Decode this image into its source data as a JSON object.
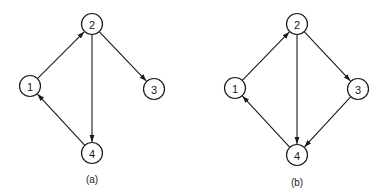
{
  "graphs": [
    {
      "caption": "(a)",
      "nodes": [
        {
          "id": "1",
          "label": "1",
          "x": 30,
          "y": 86
        },
        {
          "id": "2",
          "label": "2",
          "x": 92,
          "y": 24
        },
        {
          "id": "3",
          "label": "3",
          "x": 154,
          "y": 89
        },
        {
          "id": "4",
          "label": "4",
          "x": 92,
          "y": 153
        }
      ],
      "edges": [
        {
          "from": "1",
          "to": "2"
        },
        {
          "from": "2",
          "to": "3"
        },
        {
          "from": "2",
          "to": "4"
        },
        {
          "from": "4",
          "to": "1"
        }
      ],
      "caption_pos": {
        "x": 92,
        "y": 183
      }
    },
    {
      "caption": "(b)",
      "nodes": [
        {
          "id": "1",
          "label": "1",
          "x": 235,
          "y": 88
        },
        {
          "id": "2",
          "label": "2",
          "x": 297,
          "y": 24
        },
        {
          "id": "3",
          "label": "3",
          "x": 358,
          "y": 89
        },
        {
          "id": "4",
          "label": "4",
          "x": 297,
          "y": 155
        }
      ],
      "edges": [
        {
          "from": "1",
          "to": "2"
        },
        {
          "from": "2",
          "to": "3"
        },
        {
          "from": "2",
          "to": "4"
        },
        {
          "from": "3",
          "to": "4"
        },
        {
          "from": "4",
          "to": "1"
        }
      ],
      "caption_pos": {
        "x": 297,
        "y": 186
      }
    }
  ],
  "style": {
    "stroke": "#1a1a1a",
    "node_radius": 10.5
  }
}
